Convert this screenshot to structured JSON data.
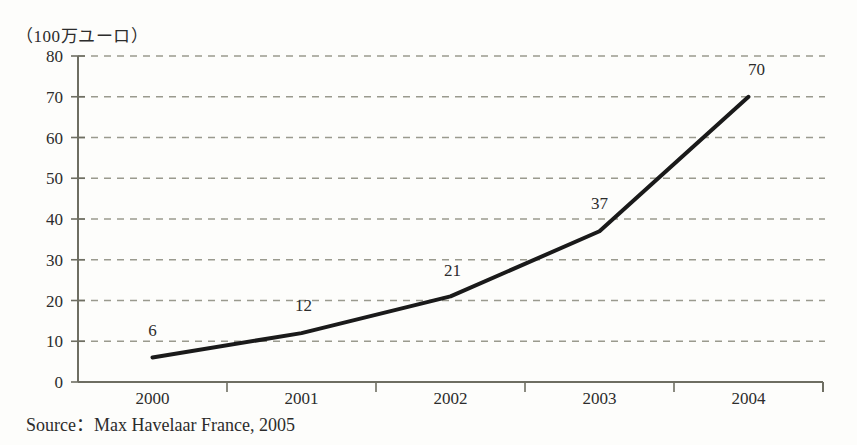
{
  "chart_data": {
    "type": "line",
    "title": "（100万ユーロ）",
    "xlabel": "",
    "ylabel": "",
    "categories": [
      "2000",
      "2001",
      "2002",
      "2003",
      "2004"
    ],
    "values": [
      6,
      12,
      21,
      37,
      70
    ],
    "point_labels": [
      "6",
      "12",
      "21",
      "37",
      "70"
    ],
    "ylim": [
      0,
      80
    ],
    "yticks": [
      "0",
      "10",
      "20",
      "30",
      "40",
      "50",
      "60",
      "70",
      "80"
    ],
    "ytick_values": [
      0,
      10,
      20,
      30,
      40,
      50,
      60,
      70,
      80
    ],
    "grid": true,
    "grid_style": "dashed-horizontal",
    "legend": "none",
    "series_color": "#1a1a1a",
    "grid_color": "#9a9a8e",
    "axis_color": "#6e6e62",
    "text_color": "#2c2c2c",
    "background_color": "#fdfdfb"
  },
  "source": {
    "text": "Source：Max Havelaar France, 2005"
  },
  "axis_title": {
    "text": "（100万ユーロ）"
  }
}
